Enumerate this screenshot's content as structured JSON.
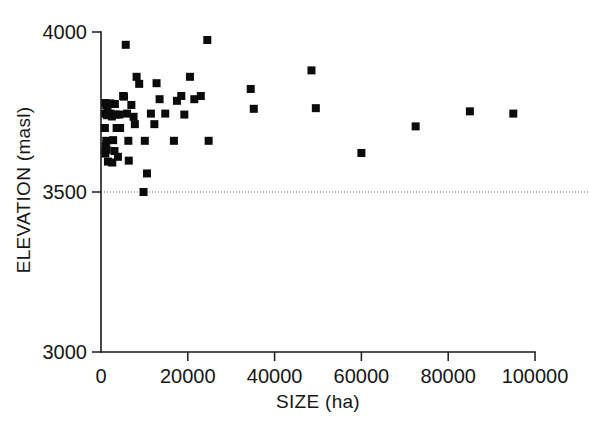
{
  "chart_data": {
    "type": "scatter",
    "title": "",
    "subtitle": "",
    "xlabel": "SIZE (ha)",
    "ylabel": "ELEVATION (masl)",
    "xlim": [
      0,
      100000
    ],
    "ylim": [
      3000,
      4000
    ],
    "xticks": [
      0,
      20000,
      40000,
      60000,
      80000,
      100000
    ],
    "xticklabels": [
      "0",
      "20000",
      "40000",
      "60000",
      "80000",
      "100000"
    ],
    "yticks": [
      3000,
      3500,
      4000
    ],
    "yticklabels": [
      "3000",
      "3500",
      "4000"
    ],
    "grid": false,
    "legend": null,
    "legend_position": "none",
    "marker": "square",
    "marker_color": "#0b0b0b",
    "marker_size_px": 8,
    "annotations": [
      {
        "name": "reference-line-3500",
        "type": "horizontal-dotted-line",
        "y": 3500,
        "style": "dotted",
        "color": "#6b6b6b"
      }
    ],
    "series": [
      {
        "name": "protected areas",
        "points": [
          [
            1000,
            3778
          ],
          [
            1200,
            3772
          ],
          [
            1500,
            3752
          ],
          [
            1000,
            3745
          ],
          [
            1400,
            3740
          ],
          [
            900,
            3700
          ],
          [
            1200,
            3660
          ],
          [
            1100,
            3643
          ],
          [
            1300,
            3632
          ],
          [
            1000,
            3620
          ],
          [
            1600,
            3595
          ],
          [
            2600,
            3592
          ],
          [
            2100,
            3777
          ],
          [
            2200,
            3745
          ],
          [
            2500,
            3736
          ],
          [
            2800,
            3662
          ],
          [
            3200,
            3775
          ],
          [
            3400,
            3742
          ],
          [
            3600,
            3700
          ],
          [
            3100,
            3628
          ],
          [
            3900,
            3610
          ],
          [
            4200,
            3742
          ],
          [
            4400,
            3700
          ],
          [
            5100,
            3800
          ],
          [
            5300,
            3798
          ],
          [
            5700,
            3960
          ],
          [
            6000,
            3745
          ],
          [
            6300,
            3660
          ],
          [
            6400,
            3598
          ],
          [
            7000,
            3772
          ],
          [
            7500,
            3735
          ],
          [
            7800,
            3712
          ],
          [
            8200,
            3860
          ],
          [
            8800,
            3838
          ],
          [
            9800,
            3500
          ],
          [
            10100,
            3660
          ],
          [
            10600,
            3558
          ],
          [
            11500,
            3745
          ],
          [
            12300,
            3712
          ],
          [
            12800,
            3840
          ],
          [
            13500,
            3790
          ],
          [
            14800,
            3745
          ],
          [
            16800,
            3660
          ],
          [
            17500,
            3785
          ],
          [
            18500,
            3800
          ],
          [
            19200,
            3742
          ],
          [
            20500,
            3860
          ],
          [
            21500,
            3790
          ],
          [
            23000,
            3800
          ],
          [
            24500,
            3975
          ],
          [
            24800,
            3660
          ],
          [
            34500,
            3822
          ],
          [
            35200,
            3760
          ],
          [
            48500,
            3880
          ],
          [
            49500,
            3762
          ],
          [
            60000,
            3622
          ],
          [
            72500,
            3705
          ],
          [
            85000,
            3752
          ],
          [
            95000,
            3745
          ]
        ]
      }
    ]
  }
}
